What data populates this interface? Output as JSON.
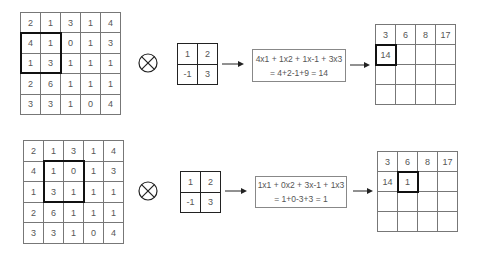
{
  "panels": [
    {
      "input_matrix": [
        [
          2,
          1,
          3,
          1,
          4
        ],
        [
          4,
          1,
          0,
          1,
          3
        ],
        [
          1,
          3,
          1,
          1,
          1
        ],
        [
          2,
          6,
          1,
          1,
          1
        ],
        [
          3,
          3,
          1,
          0,
          4
        ]
      ],
      "input_highlight": {
        "row": 1,
        "col": 0,
        "size": 2
      },
      "operator_icon": "circle-times-icon",
      "kernel": [
        [
          1,
          2
        ],
        [
          -1,
          3
        ]
      ],
      "equation_line1": "4x1 + 1x2 + 1x-1 + 3x3",
      "equation_line2": "= 4+2-1+9 = 14",
      "output_matrix": [
        [
          "3",
          "6",
          "8",
          "17"
        ],
        [
          "14",
          "",
          "",
          ""
        ],
        [
          "",
          "",
          "",
          ""
        ],
        [
          "",
          "",
          "",
          ""
        ]
      ],
      "output_highlight": {
        "row": 1,
        "col": 0
      }
    },
    {
      "input_matrix": [
        [
          2,
          1,
          3,
          1,
          4
        ],
        [
          4,
          1,
          0,
          1,
          3
        ],
        [
          1,
          3,
          1,
          1,
          1
        ],
        [
          2,
          6,
          1,
          1,
          1
        ],
        [
          3,
          3,
          1,
          0,
          4
        ]
      ],
      "input_highlight": {
        "row": 1,
        "col": 1,
        "size": 2
      },
      "operator_icon": "circle-times-icon",
      "kernel": [
        [
          1,
          2
        ],
        [
          -1,
          3
        ]
      ],
      "equation_line1": "1x1 + 0x2 + 3x-1 + 1x3",
      "equation_line2": "= 1+0-3+3 = 1",
      "output_matrix": [
        [
          "3",
          "6",
          "8",
          "17"
        ],
        [
          "14",
          "1",
          "",
          ""
        ],
        [
          "",
          "",
          "",
          ""
        ],
        [
          "",
          "",
          "",
          ""
        ]
      ],
      "output_highlight": {
        "row": 1,
        "col": 1
      }
    }
  ]
}
